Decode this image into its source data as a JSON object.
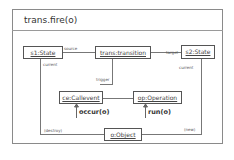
{
  "diagram": {
    "title": "trans.fire(o)",
    "objects": {
      "s1": "s1:State",
      "trans": "trans:transition",
      "s2": "s2:State",
      "ce": "ce:Callevent",
      "op": "op:Operation",
      "o": "o:Object"
    },
    "links": {
      "source": "source",
      "target": "target",
      "current_left": "current",
      "current_right": "current",
      "trigger": "trigger",
      "destroy": "(destroy)",
      "new": "(new)"
    },
    "messages": {
      "occur": "occur(o)",
      "run": "run(o)"
    },
    "colors": {
      "line": "#777777",
      "box_border": "#555555",
      "frame": "#8a8a8a"
    }
  }
}
